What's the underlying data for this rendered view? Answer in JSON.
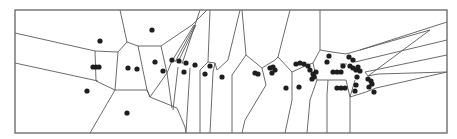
{
  "diagram": {
    "type": "voronoi",
    "title": "",
    "colors": {
      "background": "#ffffff",
      "frame": "#6e6e6e",
      "edge": "#5a5a5a",
      "site": "#1e1e1e"
    },
    "frame": {
      "x": 15,
      "y": 10,
      "width": 432,
      "height": 123
    },
    "site_radius": 2.6,
    "sites": [
      [
        100,
        41
      ],
      [
        152,
        30
      ],
      [
        93,
        67
      ],
      [
        96,
        67
      ],
      [
        99,
        67
      ],
      [
        87,
        91
      ],
      [
        128,
        68
      ],
      [
        137,
        69
      ],
      [
        127,
        113
      ],
      [
        155,
        62
      ],
      [
        163,
        71
      ],
      [
        172,
        60
      ],
      [
        179,
        61
      ],
      [
        186,
        63
      ],
      [
        195,
        65
      ],
      [
        184,
        72
      ],
      [
        205,
        74
      ],
      [
        210,
        66
      ],
      [
        222,
        77
      ],
      [
        255,
        73
      ],
      [
        258,
        74
      ],
      [
        270,
        68
      ],
      [
        273,
        67
      ],
      [
        275,
        70
      ],
      [
        272,
        73
      ],
      [
        286,
        88
      ],
      [
        299,
        87
      ],
      [
        296,
        64
      ],
      [
        300,
        63
      ],
      [
        304,
        64
      ],
      [
        308,
        66
      ],
      [
        310,
        70
      ],
      [
        313,
        74
      ],
      [
        314,
        77
      ],
      [
        312,
        79
      ],
      [
        316,
        72
      ],
      [
        329,
        56
      ],
      [
        327,
        62
      ],
      [
        333,
        72
      ],
      [
        337,
        72
      ],
      [
        341,
        72
      ],
      [
        343,
        66
      ],
      [
        349,
        57
      ],
      [
        353,
        60
      ],
      [
        350,
        66
      ],
      [
        353,
        68
      ],
      [
        356,
        70
      ],
      [
        360,
        71
      ],
      [
        358,
        67
      ],
      [
        357,
        77
      ],
      [
        337,
        88
      ],
      [
        341,
        88
      ],
      [
        345,
        88
      ],
      [
        356,
        85
      ],
      [
        355,
        91
      ],
      [
        368,
        79
      ],
      [
        371,
        81
      ],
      [
        372,
        84
      ],
      [
        369,
        87
      ],
      [
        374,
        92
      ]
    ],
    "edges": [
      [
        15,
        33,
        95,
        51
      ],
      [
        15,
        63,
        98,
        81
      ],
      [
        95,
        51,
        96,
        81
      ],
      [
        96,
        81,
        115,
        90
      ],
      [
        95,
        51,
        118,
        52
      ],
      [
        118,
        52,
        127,
        42
      ],
      [
        127,
        42,
        120,
        10
      ],
      [
        127,
        42,
        138,
        46
      ],
      [
        138,
        46,
        161,
        46
      ],
      [
        161,
        46,
        192,
        25
      ],
      [
        192,
        25,
        207,
        10
      ],
      [
        115,
        90,
        118,
        52
      ],
      [
        115,
        90,
        90,
        133
      ],
      [
        115,
        90,
        147,
        90
      ],
      [
        147,
        90,
        138,
        46
      ],
      [
        147,
        90,
        150,
        97
      ],
      [
        150,
        97,
        177,
        108
      ],
      [
        177,
        108,
        185,
        127
      ],
      [
        185,
        127,
        186,
        133
      ],
      [
        150,
        97,
        147,
        90
      ],
      [
        161,
        46,
        167,
        73
      ],
      [
        167,
        73,
        150,
        97
      ],
      [
        167,
        73,
        172,
        61
      ],
      [
        172,
        61,
        194,
        25
      ],
      [
        175,
        62,
        195,
        25
      ],
      [
        178,
        62,
        196,
        25
      ],
      [
        182,
        64,
        200,
        10
      ],
      [
        167,
        73,
        172,
        108
      ],
      [
        178,
        67,
        173,
        110
      ],
      [
        190,
        68,
        186,
        133
      ],
      [
        200,
        70,
        200,
        133
      ],
      [
        200,
        70,
        208,
        62
      ],
      [
        208,
        62,
        215,
        63
      ],
      [
        215,
        63,
        217,
        70
      ],
      [
        217,
        70,
        228,
        60
      ],
      [
        228,
        60,
        240,
        10
      ],
      [
        210,
        10,
        208,
        62
      ],
      [
        215,
        63,
        213,
        72
      ],
      [
        213,
        72,
        210,
        133
      ],
      [
        242,
        10,
        246,
        55
      ],
      [
        246,
        55,
        262,
        68
      ],
      [
        246,
        55,
        232,
        75
      ],
      [
        232,
        75,
        232,
        133
      ],
      [
        262,
        68,
        266,
        85
      ],
      [
        262,
        68,
        275,
        60
      ],
      [
        275,
        60,
        278,
        57
      ],
      [
        266,
        85,
        245,
        120
      ],
      [
        245,
        120,
        242,
        133
      ],
      [
        278,
        57,
        290,
        10
      ],
      [
        278,
        57,
        292,
        72
      ],
      [
        292,
        72,
        292,
        100
      ],
      [
        292,
        72,
        305,
        66
      ],
      [
        292,
        100,
        285,
        133
      ],
      [
        305,
        66,
        313,
        63
      ],
      [
        313,
        63,
        317,
        80
      ],
      [
        317,
        80,
        310,
        100
      ],
      [
        310,
        100,
        307,
        133
      ],
      [
        320,
        10,
        320,
        50
      ],
      [
        320,
        50,
        313,
        63
      ],
      [
        320,
        50,
        332,
        52
      ],
      [
        332,
        52,
        346,
        54
      ],
      [
        317,
        80,
        328,
        80
      ],
      [
        328,
        80,
        327,
        95
      ],
      [
        327,
        95,
        327,
        133
      ],
      [
        328,
        80,
        346,
        80
      ],
      [
        346,
        80,
        350,
        97
      ],
      [
        350,
        97,
        350,
        133
      ],
      [
        340,
        64,
        347,
        64
      ],
      [
        346,
        54,
        360,
        50
      ],
      [
        360,
        50,
        447,
        22
      ],
      [
        355,
        62,
        447,
        40
      ],
      [
        360,
        50,
        430,
        30
      ],
      [
        430,
        30,
        368,
        76
      ],
      [
        365,
        72,
        447,
        55
      ],
      [
        368,
        76,
        378,
        74
      ],
      [
        378,
        74,
        447,
        72
      ],
      [
        376,
        88,
        447,
        72
      ],
      [
        350,
        97,
        366,
        92
      ],
      [
        366,
        92,
        376,
        88
      ],
      [
        368,
        76,
        365,
        72
      ],
      [
        355,
        80,
        350,
        97
      ]
    ]
  }
}
